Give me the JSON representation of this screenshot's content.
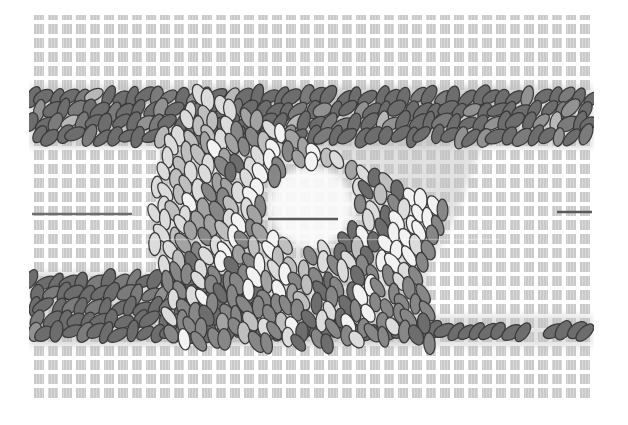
{
  "figure": {
    "name": "particle-simulation-snapshot",
    "canvas": {
      "w": 628,
      "h": 425,
      "background": "#ffffff"
    },
    "grid": {
      "x": 30,
      "y": 15,
      "w": 562,
      "h": 387,
      "period": 14,
      "lane": 4,
      "square": "#c9c9c9",
      "bg": "#ffffff",
      "striation": "rgba(255,255,255,0.32)"
    },
    "particle": {
      "rx": 10.6,
      "ry": 5.9,
      "stroke": "#3a3a3a",
      "strokeWidth": 1.25
    },
    "clip": {
      "x": 29,
      "y": 13,
      "w": 565,
      "h": 391
    },
    "blur": 3.5,
    "underlays": [
      {
        "name": "top-band-underlay",
        "type": "rect",
        "x": 30,
        "y": 86,
        "w": 562,
        "h": 62,
        "color": "#bcbcbc",
        "opacity": 0.55
      },
      {
        "name": "slab-underlay",
        "type": "polygon",
        "points": [
          [
            200,
            88
          ],
          [
            525,
            88
          ],
          [
            480,
            150
          ],
          [
            458,
            210
          ],
          [
            428,
            272
          ],
          [
            432,
            345
          ],
          [
            170,
            345
          ],
          [
            162,
            278
          ],
          [
            150,
            250
          ],
          [
            160,
            150
          ]
        ],
        "color": "#c4c4c4",
        "opacity": 0.5
      },
      {
        "name": "bottom-band-underlay",
        "type": "rect",
        "x": 30,
        "y": 272,
        "w": 235,
        "h": 74,
        "color": "#bcbcbc",
        "opacity": 0.55
      },
      {
        "name": "rope-underlay",
        "type": "rect",
        "x": 258,
        "y": 315,
        "w": 334,
        "h": 32,
        "color": "#c2c2c2",
        "opacity": 0.45
      },
      {
        "name": "hole-glow",
        "type": "ellipse",
        "cx": 311,
        "cy": 207,
        "rx": 42,
        "ry": 40,
        "color": "#ffffff",
        "opacity": 0.85
      }
    ],
    "regions": [
      {
        "name": "top-band-particles",
        "type": "rows",
        "seed": 11,
        "x0": 33,
        "x1": 591,
        "rows": [
          97,
          110,
          123,
          136
        ],
        "dx": 12.4,
        "stagger": 6,
        "jitter": [
          2.5,
          2.2
        ],
        "angles": [
          -32,
          -66
        ],
        "angleJitter": 12,
        "palette": [
          "#6d6d6d",
          "#7b7b7b",
          "#929292",
          "#b8b8b8"
        ],
        "weights": [
          0.72,
          0.16,
          0.08,
          0.04
        ]
      },
      {
        "name": "bottom-band-particles",
        "type": "rows",
        "seed": 23,
        "x0": 33,
        "x1": 262,
        "rows": [
          281,
          294,
          307,
          320,
          333
        ],
        "dx": 12.4,
        "stagger": 6,
        "jitter": [
          2.5,
          2.2
        ],
        "angles": [
          -32,
          -66
        ],
        "angleJitter": 12,
        "palette": [
          "#6d6d6d",
          "#7b7b7b",
          "#929292",
          "#b8b8b8"
        ],
        "weights": [
          0.78,
          0.14,
          0.06,
          0.02
        ]
      },
      {
        "name": "bottom-rope-particles",
        "type": "rows",
        "seed": 37,
        "x0": 262,
        "x1": 592,
        "rows": [
          331
        ],
        "dx": 10.8,
        "stagger": 0,
        "jitter": [
          2.0,
          1.6
        ],
        "angles": [
          -30,
          -50
        ],
        "angleJitter": 8,
        "gaps": [
          [
            529,
            545
          ]
        ],
        "palette": [
          "#6d6d6d",
          "#7b7b7b"
        ],
        "weights": [
          0.9,
          0.1
        ]
      },
      {
        "name": "slab-particles",
        "type": "lattice",
        "seed": 7,
        "origin": [
          150,
          74
        ],
        "u": [
          11.8,
          5.5
        ],
        "v": [
          -5.9,
          12.7
        ],
        "ni": 36,
        "nj": 24,
        "jitter": 2.8,
        "angles": [
          60,
          85
        ],
        "angleJitter": 9,
        "polygon": [
          [
            200,
            88
          ],
          [
            525,
            88
          ],
          [
            480,
            150
          ],
          [
            458,
            210
          ],
          [
            428,
            272
          ],
          [
            432,
            345
          ],
          [
            170,
            345
          ],
          [
            162,
            278
          ],
          [
            150,
            250
          ],
          [
            160,
            150
          ]
        ],
        "hole": {
          "cx": 311,
          "cy": 208,
          "rx": 47,
          "ry": 44
        },
        "rightEdge": [
          [
            525,
            88
          ],
          [
            480,
            150
          ],
          [
            458,
            210
          ],
          [
            428,
            272
          ],
          [
            432,
            345
          ]
        ],
        "leftEdge": [
          [
            200,
            88
          ],
          [
            160,
            150
          ],
          [
            150,
            250
          ],
          [
            162,
            278
          ],
          [
            170,
            345
          ]
        ],
        "rightDarken": {
          "dist": 20,
          "minIndex": 4
        },
        "leftLighten": {
          "dist": 13,
          "maxIndex": 1
        },
        "bottomBias": {
          "y": 272,
          "p": 0.5,
          "minIndex": 4
        },
        "palette": [
          "#f2f2f2",
          "#dcdcdc",
          "#bfbfbf",
          "#a3a3a3",
          "#878787",
          "#6d6d6d"
        ],
        "weights": [
          0.2,
          0.15,
          0.13,
          0.15,
          0.17,
          0.2
        ]
      }
    ],
    "lines": [
      {
        "name": "crack-line-left",
        "x1": 32,
        "x2": 132,
        "y": 214,
        "color": "#6e6e6e",
        "w": 2.4,
        "opacity": 1
      },
      {
        "name": "crack-line-center",
        "x1": 268,
        "x2": 338,
        "y": 219,
        "color": "#5a5a5a",
        "w": 2.6,
        "opacity": 1
      },
      {
        "name": "crack-line-right",
        "x1": 557,
        "x2": 592,
        "y": 212,
        "color": "#5a5a5a",
        "w": 2.6,
        "opacity": 1
      },
      {
        "name": "scan-artifact-line",
        "x1": 140,
        "x2": 500,
        "y": 239.5,
        "color": "#ffffff",
        "w": 1.6,
        "opacity": 0.32
      }
    ]
  }
}
